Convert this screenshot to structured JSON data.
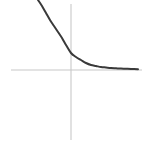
{
  "figure": {
    "title": "",
    "width": 145,
    "height": 152,
    "background_color": "#ffffff"
  },
  "axes": {
    "x_axis": {
      "name": "horizontal-axis",
      "color": "#c8c8c8",
      "y_pixel": 70,
      "x_start_pixel": 11,
      "x_end_pixel": 142
    },
    "y_axis": {
      "name": "vertical-axis",
      "color": "#c8c8c8",
      "x_pixel": 71,
      "y_start_pixel": 4,
      "y_end_pixel": 140
    },
    "origin_pixel": [
      71,
      70
    ],
    "tick_labels_x": [],
    "tick_labels_y": [],
    "grid": false
  },
  "chart_data": {
    "type": "line",
    "title": "",
    "subtitle": "",
    "xlabel": "",
    "ylabel": "",
    "grid": false,
    "legend": [],
    "legend_position": "none",
    "annotations": [],
    "xlim": [
      -2.6,
      3.2
    ],
    "ylim": [
      -3.1,
      1.6
    ],
    "series": [
      {
        "name": "exponential-decay",
        "color": "#3a3a3a",
        "line_width": 2,
        "style": "solid",
        "x": [
          -2.6,
          -2.4,
          -2.2,
          -2.0,
          -1.8,
          -1.6,
          -1.4,
          -1.2,
          -1.0,
          -0.8,
          -0.6,
          -0.4,
          -0.2,
          0.0,
          0.2,
          0.4,
          0.6,
          0.8,
          1.0,
          1.2,
          1.4,
          1.6,
          1.8,
          2.0,
          2.2,
          2.4,
          2.6,
          2.8,
          3.0
        ],
        "y": [
          1.56,
          1.42,
          1.28,
          1.15,
          1.03,
          0.92,
          0.81,
          0.71,
          0.62,
          0.54,
          0.46,
          0.39,
          0.33,
          0.28,
          0.23,
          0.19,
          0.15,
          0.12,
          0.09,
          0.07,
          0.06,
          0.045,
          0.035,
          0.028,
          0.022,
          0.018,
          0.015,
          0.012,
          0.01
        ],
        "pixel_path": [
          [
            38,
            0
          ],
          [
            42,
            6
          ],
          [
            46,
            13
          ],
          [
            50,
            20
          ],
          [
            54,
            26
          ],
          [
            58,
            32
          ],
          [
            62,
            38
          ],
          [
            66,
            45
          ],
          [
            71,
            53
          ],
          [
            76,
            57
          ],
          [
            81,
            60
          ],
          [
            86,
            63
          ],
          [
            91,
            65
          ],
          [
            96,
            66
          ],
          [
            101,
            67
          ],
          [
            106,
            67.5
          ],
          [
            111,
            68
          ],
          [
            116,
            68.3
          ],
          [
            121,
            68.6
          ],
          [
            126,
            68.8
          ],
          [
            131,
            69
          ],
          [
            138,
            69.2
          ]
        ]
      }
    ]
  }
}
